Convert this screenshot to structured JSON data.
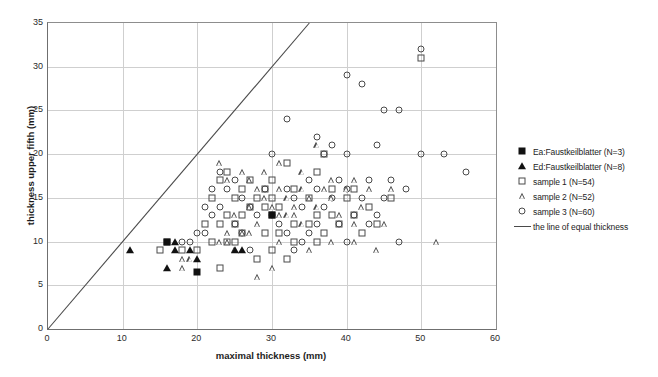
{
  "chart_data": {
    "type": "scatter",
    "title": "",
    "xlabel": "maximal thickness (mm)",
    "ylabel": "thickness upper fifth (mm)",
    "xlim": [
      0,
      60
    ],
    "ylim": [
      0,
      35
    ],
    "xticks": [
      0,
      10,
      20,
      30,
      40,
      50,
      60
    ],
    "yticks": [
      0,
      5,
      10,
      15,
      20,
      25,
      30,
      35
    ],
    "grid": true,
    "legend_position": "right",
    "series": [
      {
        "name": "Ea:Faustkeilblatter (N=3)",
        "marker": "filled-square",
        "points": [
          [
            16,
            10
          ],
          [
            20,
            6.5
          ],
          [
            30,
            13
          ]
        ]
      },
      {
        "name": "Ed:Faustkeilblatter (N=8)",
        "marker": "filled-triangle",
        "points": [
          [
            11,
            9
          ],
          [
            17,
            10
          ],
          [
            17,
            9
          ],
          [
            19,
            9
          ],
          [
            20,
            8
          ],
          [
            16,
            7
          ],
          [
            25,
            9
          ],
          [
            26,
            9
          ]
        ]
      },
      {
        "name": "sample 1 (N=54)",
        "marker": "open-square",
        "points": [
          [
            24,
            18
          ],
          [
            27,
            17
          ],
          [
            30,
            17
          ],
          [
            32,
            19
          ],
          [
            36,
            18
          ],
          [
            37,
            20
          ],
          [
            23,
            17
          ],
          [
            26,
            16
          ],
          [
            29,
            16
          ],
          [
            33,
            16
          ],
          [
            38,
            16
          ],
          [
            41,
            16
          ],
          [
            22,
            15
          ],
          [
            25,
            15
          ],
          [
            28,
            15
          ],
          [
            30,
            15
          ],
          [
            35,
            15
          ],
          [
            40,
            15
          ],
          [
            46,
            15
          ],
          [
            27,
            14
          ],
          [
            29,
            14
          ],
          [
            31,
            14
          ],
          [
            43,
            14
          ],
          [
            24,
            13
          ],
          [
            26,
            13
          ],
          [
            30,
            13
          ],
          [
            36,
            13
          ],
          [
            38,
            13
          ],
          [
            41,
            13
          ],
          [
            21,
            12
          ],
          [
            23,
            12
          ],
          [
            25,
            12
          ],
          [
            33,
            12
          ],
          [
            35,
            12
          ],
          [
            39,
            12
          ],
          [
            44,
            12
          ],
          [
            26,
            11
          ],
          [
            29,
            11
          ],
          [
            31,
            11
          ],
          [
            37,
            11
          ],
          [
            42,
            11
          ],
          [
            16,
            10
          ],
          [
            22,
            10
          ],
          [
            24,
            10
          ],
          [
            25,
            10
          ],
          [
            33,
            10
          ],
          [
            36,
            10
          ],
          [
            15,
            9
          ],
          [
            18,
            9
          ],
          [
            20,
            9
          ],
          [
            30,
            9
          ],
          [
            28,
            8
          ],
          [
            32,
            8
          ],
          [
            23,
            7
          ],
          [
            50,
            31
          ]
        ]
      },
      {
        "name": "sample 2 (N=52)",
        "marker": "open-triangle",
        "points": [
          [
            36,
            21
          ],
          [
            23,
            19
          ],
          [
            31,
            19
          ],
          [
            26,
            18
          ],
          [
            29,
            18
          ],
          [
            34,
            18
          ],
          [
            24,
            17
          ],
          [
            27,
            17
          ],
          [
            38,
            17
          ],
          [
            41,
            17
          ],
          [
            28,
            16
          ],
          [
            31,
            16
          ],
          [
            34,
            16
          ],
          [
            37,
            16
          ],
          [
            40,
            16
          ],
          [
            43,
            16
          ],
          [
            46,
            16
          ],
          [
            29,
            15
          ],
          [
            32,
            15
          ],
          [
            35,
            15
          ],
          [
            38,
            15
          ],
          [
            27,
            14
          ],
          [
            30,
            14
          ],
          [
            33,
            14
          ],
          [
            36,
            14
          ],
          [
            42,
            14
          ],
          [
            25,
            13
          ],
          [
            31,
            13
          ],
          [
            32,
            13
          ],
          [
            33,
            13
          ],
          [
            39,
            13
          ],
          [
            28,
            12
          ],
          [
            34,
            12
          ],
          [
            41,
            12
          ],
          [
            45,
            12
          ],
          [
            26,
            11
          ],
          [
            27,
            11
          ],
          [
            24,
            11
          ],
          [
            23,
            10
          ],
          [
            24,
            10
          ],
          [
            31,
            10
          ],
          [
            38,
            10
          ],
          [
            41,
            10
          ],
          [
            52,
            10
          ],
          [
            18,
            8
          ],
          [
            19,
            8
          ],
          [
            18,
            7
          ],
          [
            30,
            7
          ],
          [
            25,
            9
          ],
          [
            35,
            9
          ],
          [
            44,
            9
          ],
          [
            28,
            6
          ]
        ]
      },
      {
        "name": "sample 3 (N=60)",
        "marker": "open-circle",
        "points": [
          [
            50,
            32
          ],
          [
            32,
            24
          ],
          [
            40,
            29
          ],
          [
            42,
            28
          ],
          [
            45,
            25
          ],
          [
            47,
            25
          ],
          [
            36,
            22
          ],
          [
            38,
            21
          ],
          [
            44,
            21
          ],
          [
            50,
            20
          ],
          [
            53,
            20
          ],
          [
            37,
            20
          ],
          [
            40,
            20
          ],
          [
            30,
            20
          ],
          [
            56,
            18
          ],
          [
            23,
            18
          ],
          [
            25,
            17
          ],
          [
            35,
            17
          ],
          [
            39,
            17
          ],
          [
            43,
            17
          ],
          [
            46,
            17
          ],
          [
            22,
            16
          ],
          [
            24,
            16
          ],
          [
            29,
            16
          ],
          [
            32,
            16
          ],
          [
            36,
            16
          ],
          [
            40,
            16
          ],
          [
            48,
            16
          ],
          [
            26,
            15
          ],
          [
            33,
            15
          ],
          [
            38,
            15
          ],
          [
            42,
            15
          ],
          [
            45,
            15
          ],
          [
            21,
            14
          ],
          [
            23,
            14
          ],
          [
            27,
            14
          ],
          [
            34,
            14
          ],
          [
            37,
            14
          ],
          [
            22,
            13
          ],
          [
            28,
            13
          ],
          [
            30,
            13
          ],
          [
            41,
            13
          ],
          [
            44,
            13
          ],
          [
            25,
            12
          ],
          [
            31,
            12
          ],
          [
            36,
            12
          ],
          [
            39,
            12
          ],
          [
            43,
            12
          ],
          [
            20,
            11
          ],
          [
            21,
            11
          ],
          [
            26,
            11
          ],
          [
            32,
            11
          ],
          [
            35,
            11
          ],
          [
            18,
            10
          ],
          [
            19,
            10
          ],
          [
            34,
            10
          ],
          [
            40,
            10
          ],
          [
            47,
            10
          ],
          [
            27,
            9
          ],
          [
            33,
            9
          ]
        ]
      }
    ],
    "reference_line": {
      "name": "the line of equal thickness",
      "from": [
        0,
        0
      ],
      "to": [
        35,
        35
      ]
    }
  },
  "legend": {
    "items": [
      {
        "label": "Ea:Faustkeilblatter (N=3)",
        "marker": "filled-square"
      },
      {
        "label": "Ed:Faustkeilblatter (N=8)",
        "marker": "filled-triangle"
      },
      {
        "label": "sample 1 (N=54)",
        "marker": "open-square"
      },
      {
        "label": "sample 2 (N=52)",
        "marker": "open-triangle"
      },
      {
        "label": "sample 3 (N=60)",
        "marker": "open-circle"
      },
      {
        "label": "the line of equal thickness",
        "marker": "line"
      }
    ]
  },
  "colors": {
    "marker_outline": "#4a4a4a",
    "marker_fill": "#111111",
    "gridline": "#cfcfcf",
    "axis": "#6f6f6f",
    "line": "#4a4a4a",
    "background": "#ffffff"
  }
}
